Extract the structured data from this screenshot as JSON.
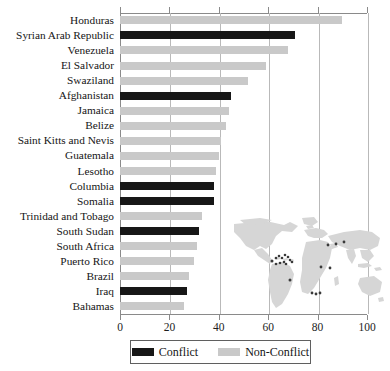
{
  "chart_data": {
    "type": "bar",
    "orientation": "horizontal",
    "title": "",
    "subtitle": "",
    "xlabel": "",
    "ylabel": "",
    "xlim": [
      0,
      100
    ],
    "ylim": null,
    "grid": true,
    "xticks": [
      0,
      20,
      40,
      60,
      80,
      100
    ],
    "xtick_labels": [
      "0",
      "20",
      "40",
      "60",
      "80",
      "100"
    ],
    "legend_position": "bottom-center",
    "legend": [
      {
        "name": "Conflict",
        "color": "#171717"
      },
      {
        "name": "Non-Conflict",
        "color": "#c9c9c9"
      }
    ],
    "categories": [
      "Honduras",
      "Syrian Arab Republic",
      "Venezuela",
      "El Salvador",
      "Swaziland",
      "Afghanistan",
      "Jamaica",
      "Belize",
      "Saint Kitts and Nevis",
      "Guatemala",
      "Lesotho",
      "Columbia",
      "Somalia",
      "Trinidad and Tobago",
      "South Sudan",
      "South Africa",
      "Puerto Rico",
      "Brazil",
      "Iraq",
      "Bahamas"
    ],
    "values": [
      90,
      71,
      68,
      59,
      52,
      45,
      44,
      43,
      41,
      40,
      39,
      38,
      38,
      33,
      32,
      31,
      30,
      28,
      27,
      26
    ],
    "group_labels": [
      "Non-Conflict",
      "Conflict",
      "Non-Conflict",
      "Non-Conflict",
      "Non-Conflict",
      "Conflict",
      "Non-Conflict",
      "Non-Conflict",
      "Non-Conflict",
      "Non-Conflict",
      "Non-Conflict",
      "Conflict",
      "Conflict",
      "Non-Conflict",
      "Conflict",
      "Non-Conflict",
      "Non-Conflict",
      "Non-Conflict",
      "Conflict",
      "Non-Conflict"
    ]
  },
  "inset": {
    "name": "world-map-inset",
    "land_color": "#d6d6d6",
    "marker_color": "#3a3a3a",
    "marker_count": 20
  }
}
